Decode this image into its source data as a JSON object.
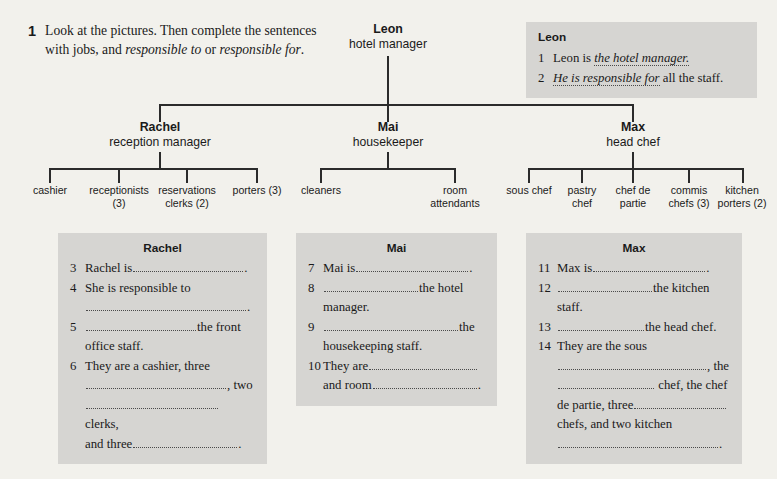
{
  "instruction": {
    "number": "1",
    "part1": "Look at the pictures. Then complete the sentences with jobs, and ",
    "em1": "responsible to",
    "mid": " or ",
    "em2": "responsible for",
    "end": "."
  },
  "org_chart": {
    "root": {
      "name": "Leon",
      "role": "hotel manager"
    },
    "managers": [
      {
        "name": "Rachel",
        "role": "reception manager"
      },
      {
        "name": "Mai",
        "role": "housekeeper"
      },
      {
        "name": "Max",
        "role": "head chef"
      }
    ],
    "leaves": {
      "rachel": [
        "cashier",
        "receptionists (3)",
        "reservations clerks (2)",
        "porters (3)"
      ],
      "mai": [
        "cleaners",
        "room attendants"
      ],
      "max": [
        "sous chef",
        "pastry chef",
        "chef de partie",
        "commis chefs (3)",
        "kitchen porters (2)"
      ]
    }
  },
  "leon_box": {
    "title": "Leon",
    "q1_num": "1",
    "q1_pre": "Leon is",
    "q1_answer": "the hotel manager.",
    "q2_num": "2",
    "q2_answer": "He is responsible for",
    "q2_post": "all the staff."
  },
  "rachel_box": {
    "title": "Rachel",
    "items": [
      {
        "num": "3",
        "pre": "Rachel is",
        "post": "."
      },
      {
        "num": "4",
        "pre": "She is responsible to",
        "post": "."
      },
      {
        "num": "5",
        "pre": "",
        "post": "the front office staff."
      },
      {
        "num": "6",
        "pre": "They are a cashier, three",
        "mid1": ", two",
        "mid2": "clerks,",
        "tail_pre": "and three",
        "post": "."
      }
    ]
  },
  "mai_box": {
    "title": "Mai",
    "items": [
      {
        "num": "7",
        "pre": "Mai is",
        "post": "."
      },
      {
        "num": "8",
        "pre": "",
        "post": "the hotel manager."
      },
      {
        "num": "9",
        "pre": "",
        "post": "the housekeeping staff."
      },
      {
        "num": "10",
        "pre": "They are",
        "mid": "and room",
        "post": "."
      }
    ]
  },
  "max_box": {
    "title": "Max",
    "items": [
      {
        "num": "11",
        "pre": "Max is",
        "post": "."
      },
      {
        "num": "12",
        "pre": "",
        "post": "the kitchen staff."
      },
      {
        "num": "13",
        "pre": "",
        "post": "the head chef."
      },
      {
        "num": "14",
        "pre": "They are the sous",
        "l2": ", the",
        "l3": "chef, the chef",
        "l4_pre": "de partie, three",
        "l5": "chefs, and two kitchen",
        "post": "."
      }
    ]
  },
  "colors": {
    "page_bg": "#f2f1ec",
    "box_bg": "#d6d5d2",
    "line": "#2b2b2b",
    "text": "#1a1a1a"
  }
}
